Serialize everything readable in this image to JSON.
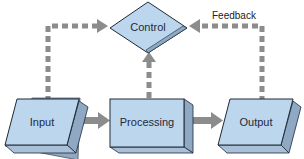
{
  "diagram": {
    "type": "flowchart",
    "nodes": [
      {
        "id": "control",
        "label": "Control",
        "shape": "diamond"
      },
      {
        "id": "input",
        "label": "Input",
        "shape": "parallelogram-3d"
      },
      {
        "id": "processing",
        "label": "Processing",
        "shape": "box-3d"
      },
      {
        "id": "output",
        "label": "Output",
        "shape": "parallelogram-3d"
      }
    ],
    "edges": [
      {
        "from": "input",
        "to": "processing",
        "style": "solid"
      },
      {
        "from": "processing",
        "to": "output",
        "style": "solid"
      },
      {
        "from": "control",
        "to": "input",
        "style": "dashed",
        "bidirectional": true
      },
      {
        "from": "control",
        "to": "processing",
        "style": "dashed",
        "bidirectional": true
      },
      {
        "from": "output",
        "to": "control",
        "style": "dashed",
        "bidirectional": true,
        "label": "Feedback"
      }
    ],
    "feedback_label": "Feedback",
    "colors": {
      "node_fill": "#bcd6ee",
      "node_side": "#8fa9c4",
      "node_stroke": "#1e2a36",
      "arrow": "#8c8c8c"
    }
  }
}
